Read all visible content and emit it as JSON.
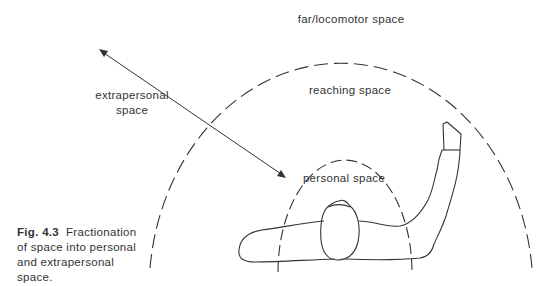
{
  "figure": {
    "number": "Fig. 4.3",
    "caption_text": "Fractionation of space into personal and extrapersonal space."
  },
  "labels": {
    "far_space": "far/locomotor space",
    "reaching_space": "reaching space",
    "personal_space": "personal space",
    "extrapersonal_line1": "extrapersonal",
    "extrapersonal_line2": "space"
  },
  "colors": {
    "line": "#333333",
    "background": "#ffffff"
  }
}
